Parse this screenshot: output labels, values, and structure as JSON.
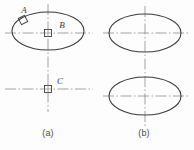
{
  "figure": {
    "background_color": "#fdfdfd",
    "line_color": "#3c3c3c",
    "centerline_color": "#8a8a8a",
    "panels": [
      {
        "id": "a",
        "caption": "(a)",
        "labels": [
          {
            "name": "A",
            "text": "A",
            "x": 24,
            "y": 13
          },
          {
            "name": "B",
            "text": "B",
            "x": 62,
            "y": 28
          },
          {
            "name": "C",
            "text": "C",
            "x": 60,
            "y": 84
          }
        ],
        "ellipses": [
          {
            "cx": 48,
            "cy": 31,
            "rx": 36,
            "ry": 19
          }
        ],
        "markers": [
          {
            "name": "square-marker-b",
            "cx": 48,
            "cy": 33,
            "size": 7
          },
          {
            "name": "square-marker-c",
            "cx": 48,
            "cy": 89,
            "size": 7
          },
          {
            "name": "square-marker-a",
            "cx": 23,
            "cy": 20,
            "size": 7,
            "rotation": -30
          }
        ],
        "centerlines": {
          "horizontal_top": {
            "x1": 5,
            "x2": 93,
            "y": 33
          },
          "horizontal_bottom": {
            "x1": 5,
            "x2": 93,
            "y": 89
          },
          "vertical": {
            "x": 48,
            "y1": 4,
            "y2": 112
          }
        }
      },
      {
        "id": "b",
        "caption": "(b)",
        "ellipses": [
          {
            "cx": 145,
            "cy": 33,
            "rx": 36,
            "ry": 19
          },
          {
            "cx": 145,
            "cy": 96,
            "rx": 36,
            "ry": 19
          }
        ],
        "centerlines": {
          "horizontal_top": {
            "x1": 103,
            "x2": 189,
            "y": 33
          },
          "horizontal_bottom": {
            "x1": 103,
            "x2": 189,
            "y": 96
          },
          "vertical": {
            "x": 145,
            "y1": 6,
            "y2": 126
          }
        }
      }
    ]
  }
}
